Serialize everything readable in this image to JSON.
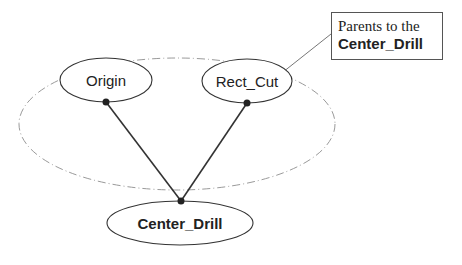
{
  "diagram": {
    "nodes": [
      {
        "id": "origin",
        "label": "Origin"
      },
      {
        "id": "rect_cut",
        "label": "Rect_Cut"
      },
      {
        "id": "center_drill",
        "label": "Center_Drill"
      }
    ],
    "edges": [
      {
        "from": "origin",
        "to": "center_drill"
      },
      {
        "from": "rect_cut",
        "to": "center_drill"
      }
    ],
    "group": {
      "label": "Parents to the Center_Drill",
      "members": [
        "origin",
        "rect_cut"
      ]
    },
    "callout": {
      "line1": "Parents to the",
      "line2": "Center_Drill"
    },
    "colors": {
      "stroke": "#333333",
      "group_stroke": "#999999",
      "callout_connector": "#777777"
    }
  }
}
